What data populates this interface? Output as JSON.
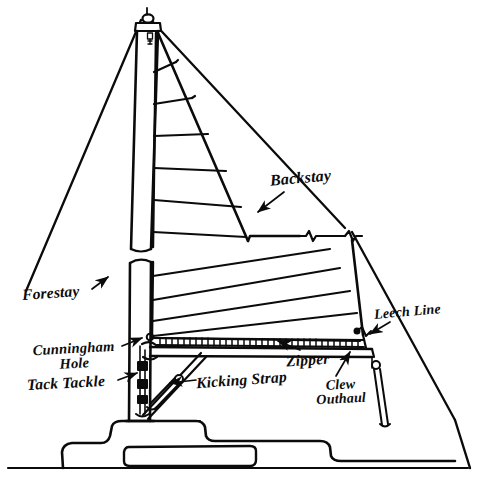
{
  "diagram": {
    "style": "hand-drawn ink line diagram",
    "colors": {
      "ink": "#0b0b0b",
      "background": "#ffffff"
    },
    "labels": [
      {
        "id": "forestay",
        "text": "Forestay",
        "lines": [
          "Forestay"
        ]
      },
      {
        "id": "backstay",
        "text": "Backstay",
        "lines": [
          "Backstay"
        ]
      },
      {
        "id": "leech_line",
        "text": "Leech Line",
        "lines": [
          "Leech Line"
        ]
      },
      {
        "id": "cunningham_hole",
        "text": "Cunningham Hole",
        "lines": [
          "Cunningham",
          "Hole"
        ]
      },
      {
        "id": "tack_tackle",
        "text": "Tack Tackle",
        "lines": [
          "Tack Tackle"
        ]
      },
      {
        "id": "zipper",
        "text": "Zipper",
        "lines": [
          "Zipper"
        ]
      },
      {
        "id": "kicking_strap",
        "text": "Kicking Strap",
        "lines": [
          "Kicking Strap"
        ]
      },
      {
        "id": "clew_outhaul",
        "text": "Clew Outhaul",
        "lines": [
          "Clew",
          "Outhaul"
        ]
      }
    ],
    "parts": [
      "masthead-fitting",
      "mast",
      "mainsail",
      "boom",
      "hull",
      "cabin-trunk",
      "cockpit",
      "waterline",
      "sail-seams",
      "reef-line",
      "gooseneck",
      "vang-tackle",
      "outhaul-tackle"
    ]
  }
}
